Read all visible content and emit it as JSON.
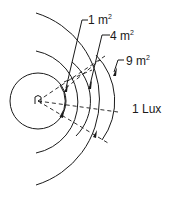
{
  "diagram": {
    "title": "",
    "source_label": "n",
    "labels": {
      "area_1": {
        "value": "1 m",
        "exp": "2"
      },
      "area_2": {
        "value": "4 m",
        "exp": "2"
      },
      "area_3": {
        "value": "9 m",
        "exp": "2"
      },
      "illuminance": "1 Lux"
    },
    "colors": {
      "line": "#1a1a1a",
      "background": "#ffffff"
    }
  }
}
